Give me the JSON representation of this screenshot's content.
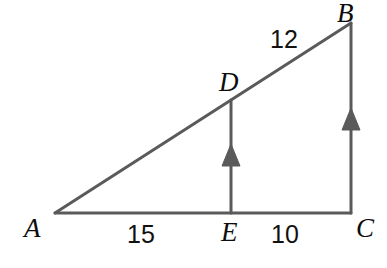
{
  "figure": {
    "type": "geometry-diagram",
    "shape": "right-triangle-with-parallel-segments",
    "background_color": "#ffffff",
    "stroke_color": "#5a5a5a",
    "label_color": "#0d0d0d",
    "width": 387,
    "height": 268
  },
  "points": {
    "A": {
      "label": "A",
      "x": 55,
      "y": 213
    },
    "B": {
      "label": "B",
      "x": 351,
      "y": 23
    },
    "C": {
      "label": "C",
      "x": 351,
      "y": 213
    },
    "D": {
      "label": "D",
      "x": 231,
      "y": 100
    },
    "E": {
      "label": "E",
      "x": 231,
      "y": 213
    }
  },
  "point_labels": [
    {
      "name": "A",
      "text": "A",
      "left": 24,
      "top": 215
    },
    {
      "name": "B",
      "text": "B",
      "left": 337,
      "top": 0
    },
    {
      "name": "C",
      "text": "C",
      "left": 356,
      "top": 215
    },
    {
      "name": "D",
      "text": "D",
      "left": 219,
      "top": 69
    },
    {
      "name": "E",
      "text": "E",
      "left": 221,
      "top": 219
    }
  ],
  "measurements": [
    {
      "name": "side-db",
      "text": "12",
      "segment": "DB",
      "left": 270,
      "top": 27
    },
    {
      "name": "side-ae",
      "text": "15",
      "segment": "AE",
      "left": 127,
      "top": 222
    },
    {
      "name": "side-ec",
      "text": "10",
      "segment": "EC",
      "left": 271,
      "top": 222
    }
  ],
  "segments": [
    {
      "name": "hypotenuse-ab",
      "from": "A",
      "to": "B"
    },
    {
      "name": "base-ac",
      "from": "A",
      "to": "C"
    },
    {
      "name": "vertical-bc",
      "from": "B",
      "to": "C",
      "arrow": "up-single"
    },
    {
      "name": "vertical-de",
      "from": "D",
      "to": "E",
      "arrow": "up-single"
    }
  ],
  "arrow_marks": [
    {
      "name": "arrow-de",
      "on": "vertical-de",
      "cx": 231,
      "cy": 156,
      "direction": "up"
    },
    {
      "name": "arrow-bc",
      "on": "vertical-bc",
      "cx": 351,
      "cy": 120,
      "direction": "up"
    }
  ]
}
